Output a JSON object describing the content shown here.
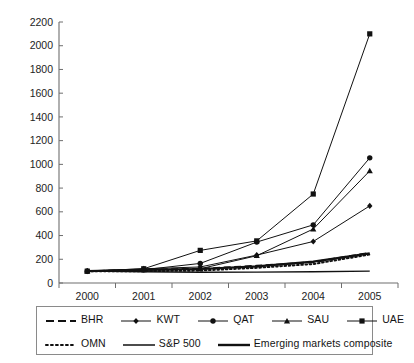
{
  "chart_data": {
    "type": "line",
    "title": "",
    "xlabel": "",
    "ylabel": "",
    "categories": [
      "2000",
      "2001",
      "2002",
      "2003",
      "2004",
      "2005"
    ],
    "x": [
      2000,
      2001,
      2002,
      2003,
      2004,
      2005
    ],
    "ylim": [
      0,
      2200
    ],
    "ytick_step": 200,
    "yticks": [
      0,
      200,
      400,
      600,
      800,
      1000,
      1200,
      1400,
      1600,
      1800,
      2000,
      2200
    ],
    "grid": false,
    "legend_position": "below-plot",
    "series": [
      {
        "name": "BHR",
        "values": [
          100,
          112,
          120,
          145,
          175,
          255
        ],
        "marker": "none",
        "dash": "dashed",
        "width": 1.9
      },
      {
        "name": "KWT",
        "values": [
          100,
          120,
          135,
          235,
          350,
          650
        ],
        "marker": "diamond",
        "dash": "solid",
        "width": 1.0
      },
      {
        "name": "QAT",
        "values": [
          100,
          112,
          165,
          345,
          490,
          1055
        ],
        "marker": "circle",
        "dash": "solid",
        "width": 1.0
      },
      {
        "name": "SAU",
        "values": [
          100,
          110,
          120,
          230,
          455,
          945
        ],
        "marker": "triangle",
        "dash": "solid",
        "width": 1.0
      },
      {
        "name": "UAE",
        "values": [
          100,
          120,
          275,
          355,
          750,
          2100
        ],
        "marker": "square",
        "dash": "solid",
        "width": 1.0
      },
      {
        "name": "OMN",
        "values": [
          100,
          100,
          105,
          128,
          160,
          240
        ],
        "marker": "none",
        "dash": "dotted",
        "width": 2.0
      },
      {
        "name": "S&P 500",
        "values": [
          100,
          95,
          90,
          92,
          95,
          100
        ],
        "marker": "none",
        "dash": "solid",
        "width": 1.4
      },
      {
        "name": "Emerging markets composite",
        "values": [
          100,
          110,
          118,
          140,
          180,
          250
        ],
        "marker": "none",
        "dash": "solid",
        "width": 2.2
      }
    ]
  },
  "legend": {
    "row1": [
      {
        "label": "BHR",
        "swatch": "dashed-line-swatch"
      },
      {
        "label": "KWT",
        "swatch": "diamond-marker-line-swatch"
      },
      {
        "label": "QAT",
        "swatch": "circle-marker-line-swatch"
      },
      {
        "label": "SAU",
        "swatch": "triangle-marker-line-swatch"
      },
      {
        "label": "UAE",
        "swatch": "square-marker-line-swatch"
      }
    ],
    "row2": [
      {
        "label": "OMN",
        "swatch": "dotted-line-swatch"
      },
      {
        "label": "S&P 500",
        "swatch": "thin-solid-line-swatch"
      },
      {
        "label": "Emerging markets composite",
        "swatch": "thick-solid-line-swatch"
      }
    ]
  },
  "colors": {
    "series": "#111111",
    "axis": "#6e6e6e",
    "text": "#1a1a1a",
    "background": "#ffffff",
    "legend_border": "#8a8a8a"
  }
}
